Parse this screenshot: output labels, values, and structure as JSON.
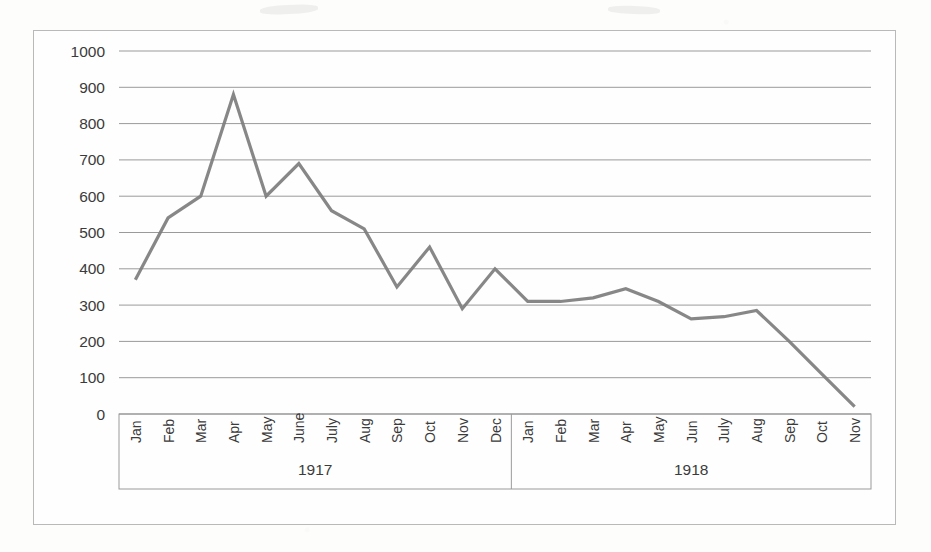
{
  "chart_data": {
    "type": "line",
    "title": "",
    "xlabel": "",
    "ylabel": "",
    "ylim": [
      0,
      1000
    ],
    "ytick_step": 100,
    "yticks": [
      "1000",
      "900",
      "800",
      "700",
      "600",
      "500",
      "400",
      "300",
      "200",
      "100",
      "0"
    ],
    "grid": true,
    "legend": "none",
    "line_color": "#7e7e7e",
    "groups": [
      {
        "label": "1917",
        "categories": [
          "Jan",
          "Feb",
          "Mar",
          "Apr",
          "May",
          "June",
          "July",
          "Aug",
          "Sep",
          "Oct",
          "Nov",
          "Dec"
        ],
        "values": [
          370,
          540,
          600,
          880,
          600,
          690,
          560,
          510,
          350,
          460,
          290,
          400
        ]
      },
      {
        "label": "1918",
        "categories": [
          "Jan",
          "Feb",
          "Mar",
          "Apr",
          "May",
          "Jun",
          "July",
          "Aug",
          "Sep",
          "Oct",
          "Nov"
        ],
        "values": [
          310,
          310,
          320,
          345,
          310,
          262,
          268,
          285,
          200,
          110,
          20
        ]
      }
    ],
    "categories": [
      "Jan",
      "Feb",
      "Mar",
      "Apr",
      "May",
      "June",
      "July",
      "Aug",
      "Sep",
      "Oct",
      "Nov",
      "Dec",
      "Jan",
      "Feb",
      "Mar",
      "Apr",
      "May",
      "Jun",
      "July",
      "Aug",
      "Sep",
      "Oct",
      "Nov"
    ],
    "values": [
      370,
      540,
      600,
      880,
      600,
      690,
      560,
      510,
      350,
      460,
      290,
      400,
      310,
      310,
      320,
      345,
      310,
      262,
      268,
      285,
      200,
      110,
      20
    ]
  }
}
